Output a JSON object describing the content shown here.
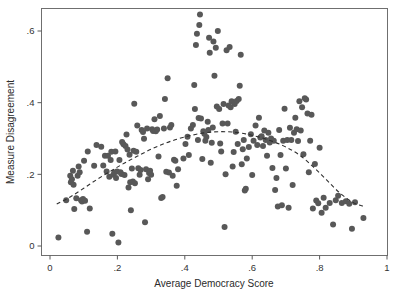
{
  "chart_data": {
    "type": "scatter",
    "title": "",
    "xlabel": "Average Democracy Score",
    "ylabel": "Measure Disagreement",
    "xlim": [
      0,
      1
    ],
    "ylim": [
      0,
      0.66
    ],
    "grid": false,
    "legend": null,
    "xticks": [
      0,
      0.2,
      0.4,
      0.6,
      0.8,
      1
    ],
    "xticklabels": [
      "0",
      ".2",
      ".4",
      ".6",
      ".8",
      "1"
    ],
    "yticks": [
      0,
      0.2,
      0.4,
      0.6
    ],
    "yticklabels": [
      "0",
      ".2",
      ".4",
      ".6"
    ],
    "marker": {
      "shape": "circle",
      "color": "#585858",
      "size": 3.0
    },
    "series": [
      {
        "name": "countries",
        "points": [
          [
            0.025,
            0.024
          ],
          [
            0.048,
            0.128
          ],
          [
            0.06,
            0.196
          ],
          [
            0.062,
            0.178
          ],
          [
            0.065,
            0.186
          ],
          [
            0.068,
            0.21
          ],
          [
            0.07,
            0.171
          ],
          [
            0.072,
            0.103
          ],
          [
            0.078,
            0.133
          ],
          [
            0.082,
            0.196
          ],
          [
            0.085,
            0.222
          ],
          [
            0.088,
            0.206
          ],
          [
            0.092,
            0.128
          ],
          [
            0.095,
            0.124
          ],
          [
            0.098,
            0.131
          ],
          [
            0.101,
            0.238
          ],
          [
            0.104,
            0.126
          ],
          [
            0.11,
            0.04
          ],
          [
            0.112,
            0.264
          ],
          [
            0.118,
            0.105
          ],
          [
            0.131,
            0.224
          ],
          [
            0.138,
            0.282
          ],
          [
            0.152,
            0.277
          ],
          [
            0.158,
            0.225
          ],
          [
            0.163,
            0.252
          ],
          [
            0.168,
            0.208
          ],
          [
            0.172,
            0.252
          ],
          [
            0.176,
            0.193
          ],
          [
            0.18,
            0.24
          ],
          [
            0.182,
            0.263
          ],
          [
            0.185,
            0.034
          ],
          [
            0.188,
            0.199
          ],
          [
            0.191,
            0.205
          ],
          [
            0.194,
            0.264
          ],
          [
            0.196,
            0.19
          ],
          [
            0.199,
            0.208
          ],
          [
            0.203,
            0.01
          ],
          [
            0.206,
            0.24
          ],
          [
            0.209,
            0.206
          ],
          [
            0.212,
            0.201
          ],
          [
            0.214,
            0.29
          ],
          [
            0.218,
            0.284
          ],
          [
            0.221,
            0.198
          ],
          [
            0.224,
            0.279
          ],
          [
            0.227,
            0.311
          ],
          [
            0.23,
            0.269
          ],
          [
            0.233,
            0.163
          ],
          [
            0.236,
            0.255
          ],
          [
            0.238,
            0.178
          ],
          [
            0.24,
            0.1
          ],
          [
            0.243,
            0.216
          ],
          [
            0.246,
            0.18
          ],
          [
            0.248,
            0.266
          ],
          [
            0.25,
            0.397
          ],
          [
            0.252,
            0.175
          ],
          [
            0.256,
            0.263
          ],
          [
            0.259,
            0.336
          ],
          [
            0.262,
            0.217
          ],
          [
            0.266,
            0.199
          ],
          [
            0.269,
            0.212
          ],
          [
            0.272,
            0.324
          ],
          [
            0.276,
            0.318
          ],
          [
            0.279,
            0.299
          ],
          [
            0.282,
            0.066
          ],
          [
            0.285,
            0.214
          ],
          [
            0.288,
            0.328
          ],
          [
            0.291,
            0.186
          ],
          [
            0.294,
            0.204
          ],
          [
            0.297,
            0.21
          ],
          [
            0.3,
            0.199
          ],
          [
            0.303,
            0.326
          ],
          [
            0.306,
            0.321
          ],
          [
            0.31,
            0.354
          ],
          [
            0.314,
            0.32
          ],
          [
            0.318,
            0.325
          ],
          [
            0.322,
            0.25
          ],
          [
            0.326,
            0.363
          ],
          [
            0.33,
            0.134
          ],
          [
            0.334,
            0.137
          ],
          [
            0.338,
            0.328
          ],
          [
            0.341,
            0.41
          ],
          [
            0.345,
            0.207
          ],
          [
            0.349,
            0.468
          ],
          [
            0.353,
            0.205
          ],
          [
            0.356,
            0.331
          ],
          [
            0.36,
            0.338
          ],
          [
            0.364,
            0.196
          ],
          [
            0.368,
            0.241
          ],
          [
            0.372,
            0.238
          ],
          [
            0.376,
            0.168
          ],
          [
            0.38,
            0.214
          ],
          [
            0.396,
            0.244
          ],
          [
            0.402,
            0.285
          ],
          [
            0.408,
            0.305
          ],
          [
            0.412,
            0.254
          ],
          [
            0.418,
            0.328
          ],
          [
            0.424,
            0.338
          ],
          [
            0.428,
            0.449
          ],
          [
            0.43,
            0.382
          ],
          [
            0.433,
            0.561
          ],
          [
            0.436,
            0.592
          ],
          [
            0.439,
            0.296
          ],
          [
            0.441,
            0.357
          ],
          [
            0.443,
            0.617
          ],
          [
            0.445,
            0.646
          ],
          [
            0.448,
            0.356
          ],
          [
            0.452,
            0.243
          ],
          [
            0.455,
            0.32
          ],
          [
            0.458,
            0.313
          ],
          [
            0.461,
            0.294
          ],
          [
            0.464,
            0.304
          ],
          [
            0.468,
            0.347
          ],
          [
            0.47,
            0.324
          ],
          [
            0.472,
            0.581
          ],
          [
            0.474,
            0.539
          ],
          [
            0.477,
            0.232
          ],
          [
            0.48,
            0.288
          ],
          [
            0.483,
            0.331
          ],
          [
            0.485,
            0.571
          ],
          [
            0.488,
            0.475
          ],
          [
            0.492,
            0.553
          ],
          [
            0.495,
            0.389
          ],
          [
            0.498,
            0.6
          ],
          [
            0.502,
            0.382
          ],
          [
            0.505,
            0.286
          ],
          [
            0.508,
            0.264
          ],
          [
            0.512,
            0.342
          ],
          [
            0.515,
            0.396
          ],
          [
            0.518,
            0.053
          ],
          [
            0.521,
            0.2
          ],
          [
            0.524,
            0.546
          ],
          [
            0.527,
            0.342
          ],
          [
            0.53,
            0.392
          ],
          [
            0.533,
            0.555
          ],
          [
            0.536,
            0.387
          ],
          [
            0.539,
            0.404
          ],
          [
            0.542,
            0.222
          ],
          [
            0.545,
            0.262
          ],
          [
            0.548,
            0.396
          ],
          [
            0.551,
            0.319
          ],
          [
            0.554,
            0.405
          ],
          [
            0.557,
            0.285
          ],
          [
            0.56,
            0.41
          ],
          [
            0.563,
            0.447
          ],
          [
            0.566,
            0.534
          ],
          [
            0.569,
            0.228
          ],
          [
            0.572,
            0.27
          ],
          [
            0.575,
            0.296
          ],
          [
            0.578,
            0.155
          ],
          [
            0.581,
            0.16
          ],
          [
            0.584,
            0.244
          ],
          [
            0.59,
            0.276
          ],
          [
            0.596,
            0.312
          ],
          [
            0.6,
            0.198
          ],
          [
            0.604,
            0.294
          ],
          [
            0.61,
            0.336
          ],
          [
            0.615,
            0.282
          ],
          [
            0.62,
            0.358
          ],
          [
            0.624,
            0.303
          ],
          [
            0.628,
            0.306
          ],
          [
            0.632,
            0.279
          ],
          [
            0.636,
            0.322
          ],
          [
            0.64,
            0.296
          ],
          [
            0.644,
            0.252
          ],
          [
            0.648,
            0.316
          ],
          [
            0.652,
            0.289
          ],
          [
            0.656,
            0.3
          ],
          [
            0.66,
            0.218
          ],
          [
            0.664,
            0.294
          ],
          [
            0.668,
            0.156
          ],
          [
            0.672,
            0.19
          ],
          [
            0.676,
            0.11
          ],
          [
            0.68,
            0.324
          ],
          [
            0.684,
            0.254
          ],
          [
            0.688,
            0.114
          ],
          [
            0.692,
            0.294
          ],
          [
            0.696,
            0.383
          ],
          [
            0.7,
            0.216
          ],
          [
            0.704,
            0.296
          ],
          [
            0.708,
            0.107
          ],
          [
            0.712,
            0.33
          ],
          [
            0.716,
            0.296
          ],
          [
            0.72,
            0.17
          ],
          [
            0.724,
            0.316
          ],
          [
            0.728,
            0.358
          ],
          [
            0.732,
            0.326
          ],
          [
            0.736,
            0.293
          ],
          [
            0.74,
            0.404
          ],
          [
            0.744,
            0.322
          ],
          [
            0.748,
            0.387
          ],
          [
            0.752,
            0.256
          ],
          [
            0.756,
            0.412
          ],
          [
            0.76,
            0.409
          ],
          [
            0.764,
            0.37
          ],
          [
            0.768,
            0.206
          ],
          [
            0.772,
            0.294
          ],
          [
            0.776,
            0.366
          ],
          [
            0.78,
            0.105
          ],
          [
            0.786,
            0.229
          ],
          [
            0.79,
            0.127
          ],
          [
            0.796,
            0.119
          ],
          [
            0.8,
            0.274
          ],
          [
            0.806,
            0.093
          ],
          [
            0.812,
            0.135
          ],
          [
            0.818,
            0.107
          ],
          [
            0.83,
            0.12
          ],
          [
            0.84,
            0.06
          ],
          [
            0.848,
            0.128
          ],
          [
            0.855,
            0.14
          ],
          [
            0.866,
            0.12
          ],
          [
            0.878,
            0.125
          ],
          [
            0.888,
            0.118
          ],
          [
            0.896,
            0.048
          ],
          [
            0.905,
            0.122
          ],
          [
            0.93,
            0.078
          ]
        ]
      }
    ],
    "fit_line": {
      "style": "dashed",
      "color": "#2f2f2f",
      "description": "quadratic lowess fit",
      "points": [
        [
          0.02,
          0.117
        ],
        [
          0.06,
          0.137
        ],
        [
          0.1,
          0.161
        ],
        [
          0.14,
          0.186
        ],
        [
          0.18,
          0.209
        ],
        [
          0.22,
          0.231
        ],
        [
          0.26,
          0.251
        ],
        [
          0.3,
          0.27
        ],
        [
          0.34,
          0.286
        ],
        [
          0.38,
          0.299
        ],
        [
          0.42,
          0.309
        ],
        [
          0.46,
          0.316
        ],
        [
          0.5,
          0.319
        ],
        [
          0.54,
          0.318
        ],
        [
          0.58,
          0.313
        ],
        [
          0.62,
          0.304
        ],
        [
          0.66,
          0.292
        ],
        [
          0.7,
          0.276
        ],
        [
          0.74,
          0.254
        ],
        [
          0.78,
          0.222
        ],
        [
          0.82,
          0.185
        ],
        [
          0.86,
          0.148
        ],
        [
          0.9,
          0.121
        ],
        [
          0.93,
          0.111
        ]
      ]
    }
  },
  "axes": {
    "x_title": "Average Democracy Score",
    "y_title": "Measure Disagreement"
  }
}
